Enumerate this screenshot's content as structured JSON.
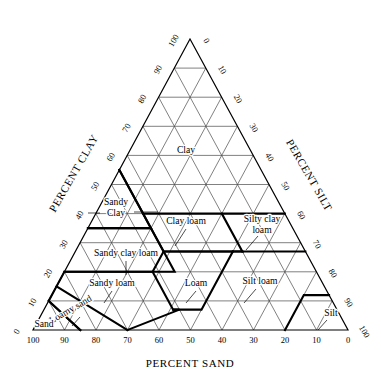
{
  "axes": {
    "bottom": {
      "name": "PERCENT SAND",
      "ticks": [
        "100",
        "90",
        "80",
        "70",
        "60",
        "50",
        "40",
        "30",
        "20",
        "10",
        "0"
      ]
    },
    "left": {
      "name": "PERCENT CLAY",
      "ticks": [
        "0",
        "10",
        "20",
        "30",
        "40",
        "50",
        "60",
        "70",
        "80",
        "90",
        "100"
      ]
    },
    "right": {
      "name": "PERCENT SILT",
      "ticks": [
        "0",
        "10",
        "20",
        "30",
        "40",
        "50",
        "60",
        "70",
        "80",
        "90",
        "100"
      ]
    }
  },
  "classes": [
    {
      "id": "clay",
      "label": "Clay",
      "lines": [
        "Clay"
      ]
    },
    {
      "id": "sandy-clay",
      "label": "Sandy Clay",
      "lines": [
        "Sandy",
        "Clay"
      ]
    },
    {
      "id": "silty-clay",
      "label": "Silty clay",
      "lines": [
        "Silty clay"
      ]
    },
    {
      "id": "clay-loam",
      "label": "Clay loam",
      "lines": [
        "Clay loam"
      ]
    },
    {
      "id": "silty-clay-loam",
      "label": "Silty clay loam",
      "lines": [
        "Silty clay",
        "loam"
      ]
    },
    {
      "id": "sandy-clay-loam",
      "label": "Sandy clay loam",
      "lines": [
        "Sandy clay loam"
      ]
    },
    {
      "id": "loam",
      "label": "Loam",
      "lines": [
        "Loam"
      ]
    },
    {
      "id": "silt-loam",
      "label": "Silt loam",
      "lines": [
        "Silt loam"
      ]
    },
    {
      "id": "sandy-loam",
      "label": "Sandy loam",
      "lines": [
        "Sandy loam"
      ]
    },
    {
      "id": "loamy-sand",
      "label": "Loamy sand",
      "lines": [
        "Loamy sand"
      ]
    },
    {
      "id": "sand",
      "label": "Sand",
      "lines": [
        "Sand"
      ]
    },
    {
      "id": "silt",
      "label": "Silt",
      "lines": [
        "Silt"
      ]
    }
  ],
  "chart_data": {
    "type": "ternary",
    "components": [
      "sand",
      "silt",
      "clay"
    ],
    "axis_ranges": {
      "sand": [
        0,
        100
      ],
      "silt": [
        0,
        100
      ],
      "clay": [
        0,
        100
      ]
    },
    "tick_interval": 10,
    "grid": true,
    "legend": "none",
    "xlabel": "PERCENT SAND",
    "ylabel": "PERCENT CLAY",
    "rlabel": "PERCENT SILT",
    "regions": [
      {
        "name": "Clay",
        "vertices_sand_silt_clay": [
          [
            0,
            0,
            100
          ],
          [
            45,
            0,
            55
          ],
          [
            45,
            15,
            40
          ],
          [
            20,
            40,
            40
          ],
          [
            0,
            60,
            40
          ]
        ]
      },
      {
        "name": "Sandy Clay",
        "vertices_sand_silt_clay": [
          [
            45,
            0,
            55
          ],
          [
            65,
            0,
            35
          ],
          [
            45,
            20,
            35
          ],
          [
            45,
            15,
            40
          ]
        ]
      },
      {
        "name": "Silty clay",
        "vertices_sand_silt_clay": [
          [
            0,
            60,
            40
          ],
          [
            20,
            40,
            40
          ],
          [
            0,
            60,
            40
          ],
          [
            0,
            60,
            40
          ]
        ]
      },
      {
        "name": "Clay loam",
        "vertices_sand_silt_clay": [
          [
            20,
            40,
            40
          ],
          [
            45,
            15,
            40
          ],
          [
            45,
            25,
            30
          ],
          [
            20,
            53,
            27
          ]
        ]
      },
      {
        "name": "Silty clay loam",
        "vertices_sand_silt_clay": [
          [
            0,
            60,
            40
          ],
          [
            20,
            40,
            40
          ],
          [
            20,
            53,
            27
          ],
          [
            0,
            73,
            27
          ]
        ]
      },
      {
        "name": "Sandy clay loam",
        "vertices_sand_silt_clay": [
          [
            45,
            20,
            35
          ],
          [
            65,
            0,
            35
          ],
          [
            80,
            0,
            20
          ],
          [
            52,
            28,
            20
          ],
          [
            45,
            35,
            20
          ]
        ]
      },
      {
        "name": "Loam",
        "vertices_sand_silt_clay": [
          [
            23,
            50,
            27
          ],
          [
            45,
            28,
            27
          ],
          [
            52,
            28,
            20
          ],
          [
            52,
            41,
            7
          ],
          [
            43,
            50,
            7
          ]
        ]
      },
      {
        "name": "Silt loam",
        "vertices_sand_silt_clay": [
          [
            0,
            73,
            27
          ],
          [
            20,
            53,
            27
          ],
          [
            23,
            50,
            27
          ],
          [
            50,
            50,
            0
          ],
          [
            20,
            80,
            0
          ],
          [
            8,
            80,
            12
          ]
        ]
      },
      {
        "name": "Sandy loam",
        "vertices_sand_silt_clay": [
          [
            52,
            28,
            20
          ],
          [
            80,
            0,
            20
          ],
          [
            85,
            0,
            15
          ],
          [
            70,
            30,
            0
          ],
          [
            50,
            43,
            7
          ],
          [
            52,
            41,
            7
          ]
        ]
      },
      {
        "name": "Loamy sand",
        "vertices_sand_silt_clay": [
          [
            85,
            0,
            15
          ],
          [
            90,
            0,
            10
          ],
          [
            85,
            15,
            0
          ],
          [
            70,
            30,
            0
          ]
        ]
      },
      {
        "name": "Sand",
        "vertices_sand_silt_clay": [
          [
            90,
            0,
            10
          ],
          [
            100,
            0,
            0
          ],
          [
            85,
            15,
            0
          ]
        ]
      },
      {
        "name": "Silt",
        "vertices_sand_silt_clay": [
          [
            0,
            88,
            12
          ],
          [
            8,
            80,
            12
          ],
          [
            20,
            80,
            0
          ],
          [
            0,
            100,
            0
          ]
        ]
      }
    ]
  }
}
